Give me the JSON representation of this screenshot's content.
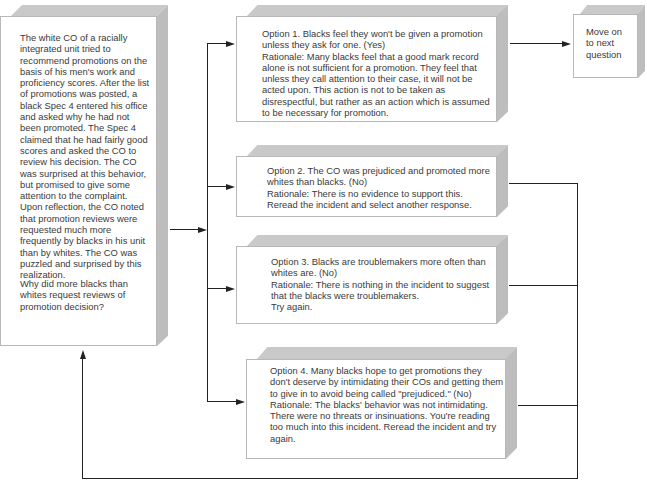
{
  "scenario": {
    "text": "The white CO of a racially integrated unit tried to recommend promotions on the basis of his men's work and proficiency scores. After the list of promotions was posted, a black Spec 4 entered his office and asked why he had not been promoted. The Spec 4 claimed that he had fairly good scores and asked the CO to review his decision. The CO was surprised at this behavior, but promised to give some attention to the complaint. Upon reflection, the CO noted that promotion reviews were requested much more frequently by blacks in his unit than by whites. The CO was puzzled and surprised by this realization.",
    "question": "Why did more blacks than whites request reviews of promotion decision?"
  },
  "options": [
    {
      "label": "Option 1.",
      "text": "Option 1.  Blacks feel they won't be given a promotion unless they ask for one.  (Yes)\nRationale:  Many blacks feel that a good mark record alone is not sufficient for a promotion. They feel that unless they call attention to their case, it will not be acted upon.  This action is not to be taken as disrespectful, but rather as an action which is assumed to be necessary for promotion.",
      "answer": "Yes"
    },
    {
      "label": "Option 2.",
      "text": "Option 2.  The CO was prejudiced and promoted more whites than blacks.  (No)\nRationale:  There is no evidence to support this. Reread the incident and select another response.",
      "answer": "No"
    },
    {
      "label": "Option 3.",
      "text": "Option 3.  Blacks are troublemakers more often than whites are. (No)\nRationale:  There is nothing in the incident to suggest that the blacks were troublemakers.\nTry again.",
      "answer": "No"
    },
    {
      "label": "Option 4.",
      "text": "Option 4.  Many blacks hope to get promotions they don't deserve by intimidating their COs and getting them to give in to avoid being called \"prejudiced.\"  (No)\nRationale:  The blacks' behavior was not intimidating.  There were no threats or insinuations.  You're reading too much into this incident.  Reread the incident and try again.",
      "answer": "No"
    }
  ],
  "next": {
    "text": "Move on\nto next\nquestion"
  },
  "colors": {
    "box_top": "#c9c9c9",
    "box_side": "#bdbdbd",
    "line": "#222222",
    "text": "#3a3a3a"
  }
}
